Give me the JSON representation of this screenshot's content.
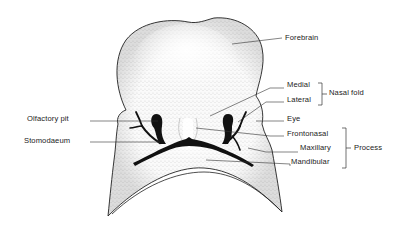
{
  "diagram": {
    "colors": {
      "ink": "#111111",
      "stipple": "#6a6a6a",
      "background": "#ffffff",
      "fill": "#f4f4f4"
    },
    "labels": {
      "forebrain": "Forebrain",
      "medial": "Medial",
      "lateral": "Lateral",
      "nasal_fold": "Nasal fold",
      "eye": "Eye",
      "olfactory_pit": "Olfactory pit",
      "stomodaeum": "Stomodaeum",
      "frontonasal": "Frontonasal",
      "maxillary": "Maxillary",
      "mandibular": "Mandibular",
      "process": "Process"
    }
  }
}
